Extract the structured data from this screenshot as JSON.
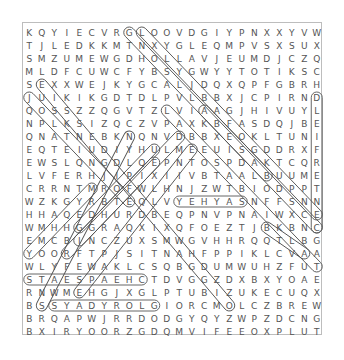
{
  "puzzle": {
    "rows": [
      "KQYIECVRGLOOVDGIYPNXXYVW",
      "TJLEDKKMTNXYGLEQMPVSXSUX",
      "SMZUMEWGDHOLLAVJEUMDJCZQ",
      "MLDFCUWCFYBSYGWYYTOTIKSC",
      "SEXXWEJKYGCALJDQXQPFGBRH",
      "JUIKIKGDTDLPVLBBXJCPIRND",
      "QOSSZZQGVTZLVIAAGJHIVUYL",
      "NPLKSIZQCZVPAXKBFASDQJBE",
      "QNATNEBKNQNVDBBXEOKLTUNI",
      "EQTEIUDIYHULMEEUISGDDRXF",
      "EWSLQNGDLQEPNTOSPDAKTCQR",
      "LVFERHJIPIXIIVBTAALBUUME",
      "CRRNTMROFWLHNJZWTBIODPPT",
      "WZKGYRBTEQLVYEHYASNFFSNN",
      "HHAQEDHURDBEQPNVPNAIWXCE",
      "WMHHGGRAQXIXQFOEZTJBKBNC",
      "EMCBINCZUXSMWGVHHRQQTLBG",
      "YOORFTPJSITNAHFPPIKLCVAA",
      "WLYFEWAKLCSQBGDUMWUHZFUT",
      "STAESPAEHCTDVGGZDXBXYOAE",
      "RNWMEHGJXGLPTUBIZUKECUQX",
      "BSSYADYROLGIORCMOLCZBREW",
      "BRQAPWJRRDODGYQYZWPZDCNG",
      "BXIRYOORZGDQMVIFEEOXPLUT"
    ],
    "found_words": [
      {
        "word": "CENTERFIELD",
        "start": [
          6,
          24
        ],
        "end": [
          16,
          24
        ]
      },
      {
        "word": "SAYHEY",
        "start": [
          14,
          13
        ],
        "end": [
          14,
          18
        ]
      },
      {
        "word": "CHEAPSEATS",
        "start": [
          20,
          1
        ],
        "end": [
          20,
          10
        ]
      },
      {
        "word": "GLORYDAYS",
        "start": [
          22,
          3
        ],
        "end": [
          22,
          11
        ]
      }
    ],
    "diagonal_highlights": [
      {
        "start": [
          1,
          9
        ],
        "end": [
          16,
          24
        ]
      },
      {
        "start": [
          1,
          10
        ],
        "end": [
          15,
          24
        ]
      },
      {
        "start": [
          5,
          2
        ],
        "end": [
          22,
          17
        ]
      },
      {
        "start": [
          6,
          1
        ],
        "end": [
          14,
          9
        ]
      },
      {
        "start": [
          7,
          12
        ],
        "end": [
          19,
          24
        ]
      },
      {
        "start": [
          9,
          9
        ],
        "end": [
          22,
          2
        ]
      },
      {
        "start": [
          10,
          14
        ],
        "end": [
          21,
          5
        ]
      },
      {
        "start": [
          12,
          20
        ],
        "end": [
          7,
          15
        ]
      },
      {
        "start": [
          9,
          13
        ],
        "end": [
          17,
          5
        ]
      },
      {
        "start": [
          13,
          6
        ],
        "end": [
          18,
          1
        ]
      },
      {
        "start": [
          10,
          11
        ],
        "end": [
          16,
          5
        ]
      },
      {
        "start": [
          16,
          20
        ],
        "end": [
          18,
          23
        ]
      },
      {
        "start": [
          18,
          4
        ],
        "end": [
          11,
          11
        ]
      }
    ]
  }
}
